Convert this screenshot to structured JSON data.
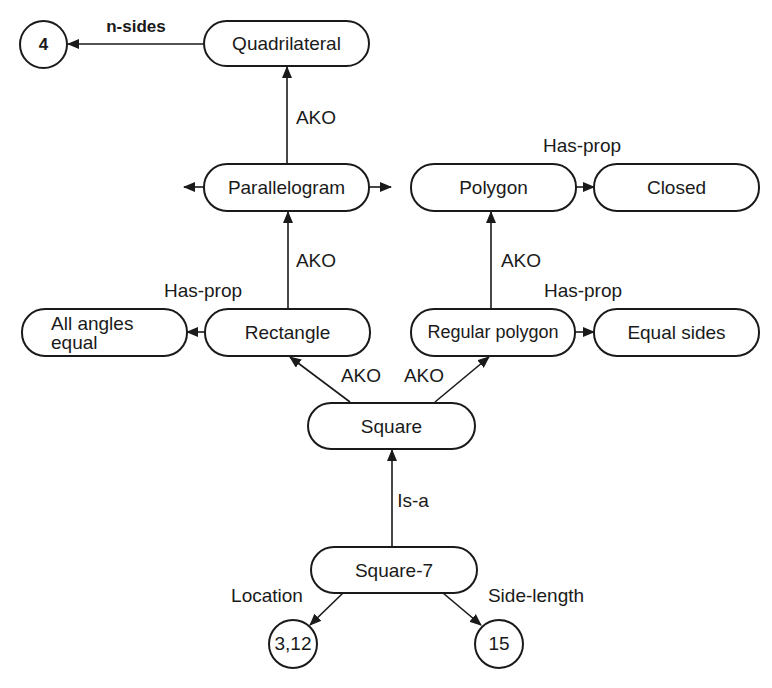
{
  "diagram": {
    "type": "semantic-network",
    "nodes": {
      "quadrilateral": "Quadrilateral",
      "parallelogram": "Parallelogram",
      "polygon": "Polygon",
      "closed": "Closed",
      "rectangle": "Rectangle",
      "all_angles_equal": "All angles equal",
      "regular_polygon": "Regular polygon",
      "equal_sides": "Equal sides",
      "square": "Square",
      "square_7": "Square-7"
    },
    "values": {
      "four": "4",
      "location": "3,12",
      "side_length": "15"
    },
    "edge_labels": {
      "n_sides": "n-sides",
      "ako_parallelogram_quadrilateral": "AKO",
      "has_prop_polygon_closed": "Has-prop",
      "ako_rectangle_parallelogram": "AKO",
      "ako_regular_polygon_polygon": "AKO",
      "has_prop_rectangle": "Has-prop",
      "has_prop_regular_polygon": "Has-prop",
      "ako_square_rectangle": "AKO",
      "ako_square_regular_polygon": "AKO",
      "is_a": "Is-a",
      "location": "Location",
      "side_length": "Side-length"
    },
    "edges": [
      {
        "from": "Quadrilateral",
        "to": "4",
        "label": "n-sides"
      },
      {
        "from": "Parallelogram",
        "to": "Quadrilateral",
        "label": "AKO"
      },
      {
        "from": "Polygon",
        "to": "Closed",
        "label": "Has-prop"
      },
      {
        "from": "Rectangle",
        "to": "Parallelogram",
        "label": "AKO"
      },
      {
        "from": "Regular polygon",
        "to": "Polygon",
        "label": "AKO"
      },
      {
        "from": "Rectangle",
        "to": "All angles equal",
        "label": "Has-prop"
      },
      {
        "from": "Regular polygon",
        "to": "Equal sides",
        "label": "Has-prop"
      },
      {
        "from": "Square",
        "to": "Rectangle",
        "label": "AKO"
      },
      {
        "from": "Square",
        "to": "Regular polygon",
        "label": "AKO"
      },
      {
        "from": "Square-7",
        "to": "Square",
        "label": "Is-a"
      },
      {
        "from": "Square-7",
        "to": "3,12",
        "label": "Location"
      },
      {
        "from": "Square-7",
        "to": "15",
        "label": "Side-length"
      }
    ]
  }
}
